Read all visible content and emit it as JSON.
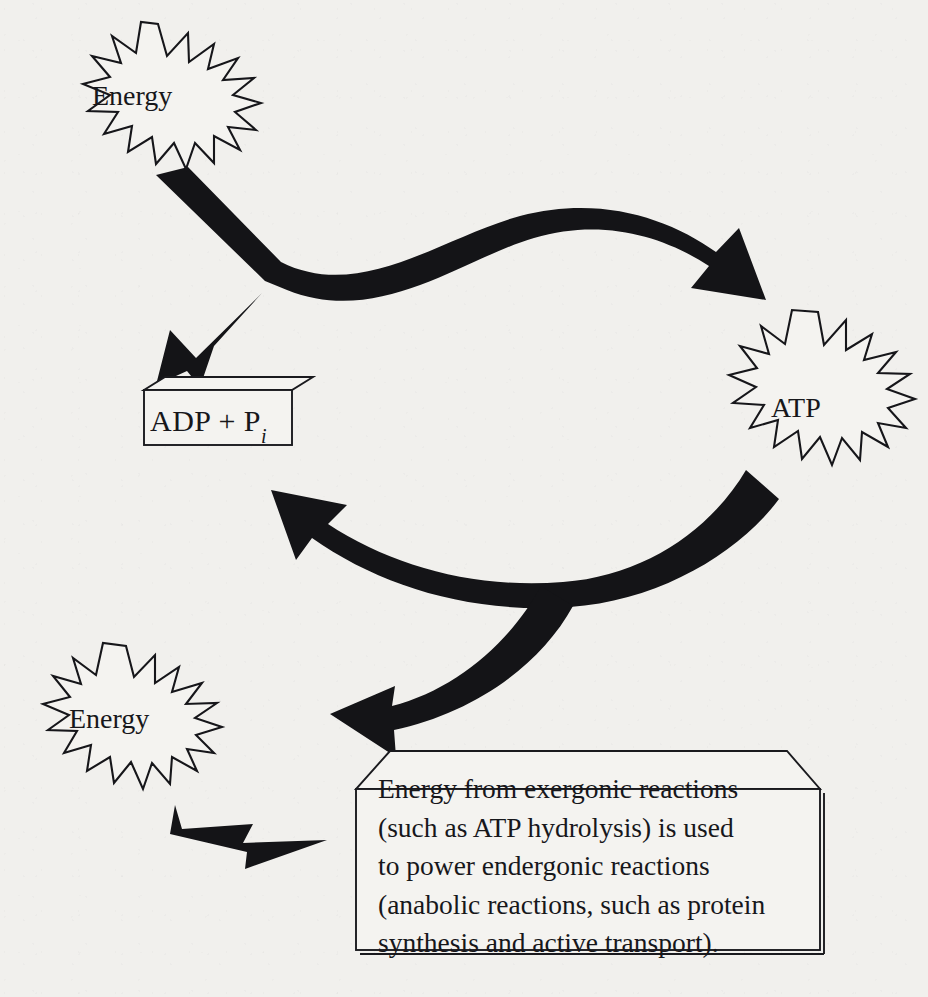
{
  "figure": {
    "type": "cycle-diagram",
    "background_color": "#f1f0ed",
    "ink_color": "#141417"
  },
  "nodes": {
    "energy_top": {
      "label": "Energy",
      "shape": "starburst"
    },
    "atp": {
      "label": "ATP",
      "shape": "starburst"
    },
    "energy_bottom": {
      "label": "Energy",
      "shape": "starburst"
    },
    "adp": {
      "label_main": "ADP + P",
      "label_subscript": "i",
      "shape": "3d-box"
    }
  },
  "callout": {
    "shape": "3d-box",
    "lines": [
      "Energy from exergonic reactions",
      "(such as ATP hydrolysis) is used",
      "to power endergonic reactions",
      "(anabolic reactions, such as protein",
      "synthesis and active transport)."
    ]
  },
  "arrows": [
    {
      "name": "energy-to-atp",
      "from": "energy_top",
      "to": "atp",
      "direction": "right"
    },
    {
      "name": "adp-to-junction",
      "from": "adp",
      "to": "energy_top",
      "direction": "up-right"
    },
    {
      "name": "atp-to-adp",
      "from": "atp",
      "to": "adp",
      "direction": "left"
    },
    {
      "name": "branch-to-energy",
      "from": "atp",
      "to": "energy_bottom",
      "direction": "down-left"
    },
    {
      "name": "energy-to-callout",
      "from": "energy_bottom",
      "to": "callout",
      "direction": "right"
    }
  ]
}
